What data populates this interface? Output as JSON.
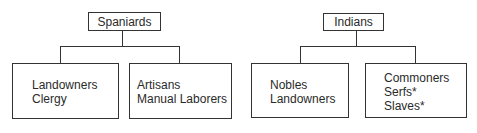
{
  "groups": [
    {
      "title": "Spaniards",
      "children": [
        {
          "lines": [
            "Landowners",
            "Clergy"
          ]
        },
        {
          "lines": [
            "Artisans",
            "Manual Laborers"
          ]
        }
      ]
    },
    {
      "title": "Indians",
      "children": [
        {
          "lines": [
            "Nobles",
            "Landowners"
          ]
        },
        {
          "lines": [
            "Commoners",
            "Serfs*",
            "Slaves*"
          ]
        }
      ]
    }
  ]
}
